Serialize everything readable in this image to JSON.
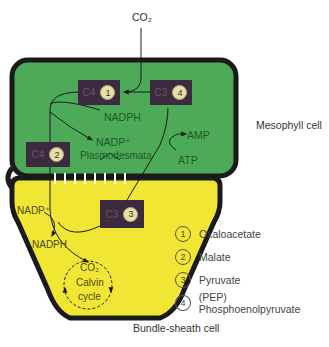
{
  "diagram": {
    "co2_input": "CO₂",
    "cells": {
      "mesophyll": {
        "label": "Mesophyll cell",
        "color": "#4caa58"
      },
      "bundle_sheath": {
        "label": "Bundle-sheath cell",
        "color": "#f2e634"
      }
    },
    "border_color": "#1a1a1a",
    "plasmodesmata_label": "Plasmodesmata",
    "mesophyll_labels": {
      "nadph": "NADPH",
      "nadp": "NADP⁺",
      "amp": "AMP",
      "atp": "ATP"
    },
    "bundle_labels": {
      "nadp": "NADP⁺",
      "nadph": "NADPH",
      "co2": "CO₂",
      "calvin_line1": "Calvin",
      "calvin_line2": "cycle"
    },
    "boxes": [
      {
        "id": "c4-1",
        "carbon": "C4",
        "num": "1"
      },
      {
        "id": "c3-4",
        "carbon": "C3",
        "num": "4"
      },
      {
        "id": "c4-2",
        "carbon": "C4",
        "num": "2"
      },
      {
        "id": "c3-3",
        "carbon": "C3",
        "num": "3"
      }
    ],
    "box_color": "#3c2b40",
    "legend": [
      {
        "num": "1",
        "text": "Oxaloacetate"
      },
      {
        "num": "2",
        "text": "Malate"
      },
      {
        "num": "3",
        "text": "Pyruvate"
      },
      {
        "num": "4",
        "text": "(PEP) Phosphoenolpyruvate"
      }
    ]
  }
}
